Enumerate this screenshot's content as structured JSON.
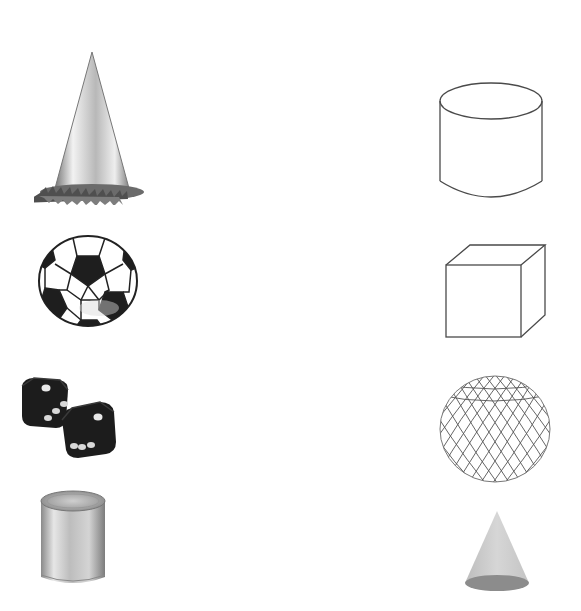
{
  "worksheet": {
    "type": "matching",
    "background": "#ffffff",
    "left_column": {
      "role": "real-world objects",
      "items": [
        {
          "name": "party-hat",
          "shape_equivalent": "cone"
        },
        {
          "name": "soccer-ball",
          "shape_equivalent": "sphere"
        },
        {
          "name": "dice",
          "shape_equivalent": "cube"
        },
        {
          "name": "tin-can",
          "shape_equivalent": "cylinder"
        }
      ]
    },
    "right_column": {
      "role": "geometric solids",
      "items": [
        {
          "name": "cylinder",
          "style": "line drawing"
        },
        {
          "name": "cube",
          "style": "line drawing"
        },
        {
          "name": "sphere",
          "style": "wire mesh"
        },
        {
          "name": "cone",
          "style": "shaded"
        }
      ]
    },
    "colors": {
      "outline": "#4a4a4a",
      "dark_fill": "#1e1e1e",
      "metal_light": "#d8d8d8",
      "metal_dark": "#8a8a8a",
      "cone_fill": "#d0d0d0",
      "cone_base": "#8c8c8c"
    }
  }
}
